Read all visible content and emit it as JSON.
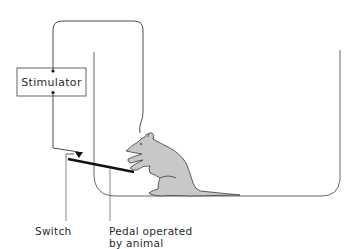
{
  "figure": {
    "components": {
      "stimulator": {
        "label": "Stimulator"
      },
      "switch": {
        "label": "Switch"
      },
      "pedal": {
        "label_line1": "Pedal operated",
        "label_line2": "by animal"
      }
    },
    "colors": {
      "line": "#3a3a3a",
      "rat_fill": "#c8c8c8",
      "pedal": "#111111",
      "text": "#2a2a2a"
    }
  }
}
